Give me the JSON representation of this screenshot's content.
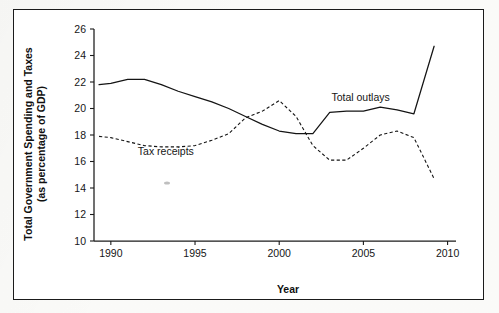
{
  "figure": {
    "frame_border_color": "#1b1b1b",
    "background_color": "#ffffff",
    "page_background_color": "#fdfdfb"
  },
  "chart_data": {
    "type": "line",
    "title": "",
    "xlabel": "Year",
    "ylabel": "Total Government Spending and Taxes\n(as percentage of GDP)",
    "ylabel_line1": "Total Government Spending and Taxes",
    "ylabel_line2": "(as percentage of GDP)",
    "xlim": [
      1989,
      2010.5
    ],
    "ylim": [
      10,
      26
    ],
    "xticks": [
      1990,
      1995,
      2000,
      2005,
      2010
    ],
    "xtick_labels": [
      "1990",
      "1995",
      "2000",
      "2005",
      "2010"
    ],
    "yticks": [
      10,
      12,
      14,
      16,
      18,
      20,
      22,
      24,
      26
    ],
    "ytick_labels": [
      "10",
      "12",
      "14",
      "16",
      "18",
      "20",
      "22",
      "24",
      "26"
    ],
    "grid": false,
    "legend_position": "inline-annotations",
    "line_color": "#141414",
    "series": [
      {
        "name": "Total outlays",
        "style": "solid",
        "label_text": "Total outlays",
        "label_x": 2003.1,
        "label_y": 20.6,
        "x": [
          1989.3,
          1990,
          1991,
          1992,
          1993,
          1994,
          1995,
          1996,
          1997,
          1998,
          1999,
          2000,
          2001,
          2002,
          2003,
          2004,
          2005,
          2006,
          2007,
          2008,
          2009.2
        ],
        "values": [
          21.8,
          21.9,
          22.2,
          22.2,
          21.8,
          21.3,
          20.9,
          20.5,
          20.0,
          19.4,
          18.8,
          18.3,
          18.1,
          18.1,
          19.7,
          19.8,
          19.8,
          20.1,
          19.9,
          19.6,
          24.7
        ]
      },
      {
        "name": "Tax receipts",
        "style": "dashed",
        "label_text": "Tax receipts",
        "label_x": 1991.6,
        "label_y": 16.5,
        "x": [
          1989.3,
          1990,
          1991,
          1992,
          1993,
          1994,
          1995,
          1996,
          1997,
          1998,
          1999,
          2000,
          2001,
          2002,
          2003,
          2004,
          2005,
          2006,
          2007,
          2008,
          2009.2
        ],
        "values": [
          17.9,
          17.8,
          17.5,
          17.2,
          17.1,
          17.1,
          17.2,
          17.6,
          18.1,
          19.3,
          19.8,
          20.6,
          19.4,
          17.2,
          16.1,
          16.1,
          17.0,
          18.0,
          18.3,
          17.8,
          14.7
        ]
      }
    ]
  },
  "axis_geometry": {
    "plot_left": 93,
    "plot_right": 455,
    "plot_top": 28,
    "plot_bottom": 240,
    "x_min": 1989,
    "x_max": 2010.5,
    "y_min": 10,
    "y_max": 26
  }
}
